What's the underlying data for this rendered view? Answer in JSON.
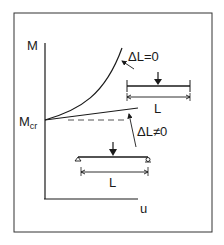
{
  "diagram": {
    "axes": {
      "y_label": "M",
      "x_label": "u",
      "y_marker": {
        "main": "M",
        "sub": "cr"
      }
    },
    "curves": [
      {
        "name": "fixed-length",
        "label": "ΔL=0"
      },
      {
        "name": "free-length",
        "label": "ΔL≠0"
      }
    ],
    "beams": [
      {
        "name": "upper-beam",
        "span_label": "L"
      },
      {
        "name": "lower-beam",
        "span_label": "L"
      }
    ],
    "colors": {
      "ink": "#1a1a1a",
      "background": "#ffffff"
    }
  }
}
